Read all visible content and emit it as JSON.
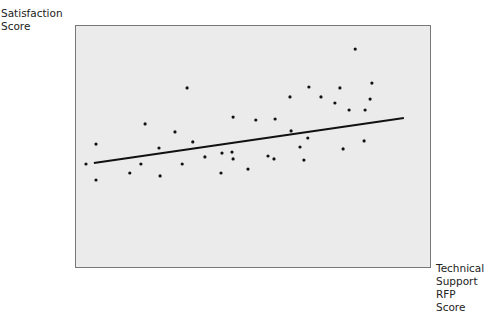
{
  "chart_data": {
    "type": "scatter",
    "title": "",
    "xlabel": "Technical Support RFP Score",
    "ylabel": "Satisfaction Score",
    "xlabel_lines": [
      "Technical",
      "Support RFP",
      "Score"
    ],
    "ylabel_lines": [
      "Satisfaction",
      "Score"
    ],
    "grid": false,
    "axis_ticks": false,
    "plot_background": "#ebebeb",
    "frame_color": "#777777",
    "point_color": "#111111",
    "line_color": "#111111",
    "note": "No numeric axes shown; values are pixel-space positions within plot frame (x: 0-100 left to right, y: 0-100 bottom to top)",
    "xlim": [
      0,
      100
    ],
    "ylim": [
      0,
      100
    ],
    "points": [
      {
        "x": 3.1,
        "y": 42.8
      },
      {
        "x": 5.9,
        "y": 36.2
      },
      {
        "x": 5.9,
        "y": 51.0
      },
      {
        "x": 15.4,
        "y": 39.1
      },
      {
        "x": 18.5,
        "y": 42.8
      },
      {
        "x": 19.7,
        "y": 59.3
      },
      {
        "x": 23.6,
        "y": 49.4
      },
      {
        "x": 23.9,
        "y": 37.9
      },
      {
        "x": 28.1,
        "y": 56.0
      },
      {
        "x": 30.1,
        "y": 42.8
      },
      {
        "x": 31.5,
        "y": 74.1
      },
      {
        "x": 33.1,
        "y": 51.9
      },
      {
        "x": 36.5,
        "y": 45.7
      },
      {
        "x": 41.0,
        "y": 39.1
      },
      {
        "x": 41.3,
        "y": 47.3
      },
      {
        "x": 44.1,
        "y": 47.7
      },
      {
        "x": 44.4,
        "y": 62.1
      },
      {
        "x": 44.4,
        "y": 44.9
      },
      {
        "x": 48.6,
        "y": 40.7
      },
      {
        "x": 50.8,
        "y": 60.9
      },
      {
        "x": 54.2,
        "y": 46.1
      },
      {
        "x": 55.9,
        "y": 44.9
      },
      {
        "x": 56.2,
        "y": 61.3
      },
      {
        "x": 60.4,
        "y": 70.4
      },
      {
        "x": 60.7,
        "y": 56.4
      },
      {
        "x": 63.2,
        "y": 49.8
      },
      {
        "x": 64.3,
        "y": 44.4
      },
      {
        "x": 65.4,
        "y": 53.5
      },
      {
        "x": 65.7,
        "y": 74.5
      },
      {
        "x": 69.1,
        "y": 70.4
      },
      {
        "x": 73.0,
        "y": 67.9
      },
      {
        "x": 74.4,
        "y": 74.1
      },
      {
        "x": 75.3,
        "y": 49.0
      },
      {
        "x": 78.7,
        "y": 90.1
      },
      {
        "x": 77.0,
        "y": 65.0
      },
      {
        "x": 81.2,
        "y": 52.3
      },
      {
        "x": 81.5,
        "y": 65.0
      },
      {
        "x": 82.9,
        "y": 69.5
      },
      {
        "x": 83.4,
        "y": 76.1
      }
    ],
    "trendline": {
      "x": [
        5.3,
        92.4
      ],
      "y": [
        43.2,
        61.7
      ]
    },
    "plot_box_px": {
      "left": 75,
      "top": 25,
      "right": 431,
      "bottom": 268
    }
  }
}
